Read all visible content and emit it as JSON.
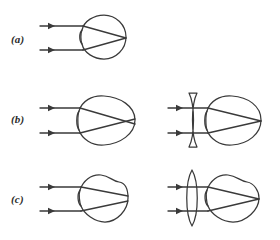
{
  "figure": {
    "background_color": "#ffffff",
    "ink_color": "#3a3a3a",
    "width": 280,
    "height": 240
  },
  "panels": [
    {
      "key": "a",
      "label": "(a)",
      "label_x": 11,
      "label_y": 33,
      "condition": "normal-eye",
      "description": "Parallel rays refract at the cornea and focus exactly on the retina",
      "has_corrective_lens": false,
      "eye_shape": "circular",
      "groups": [
        {
          "name": "uncorrected-eye-group",
          "eye": {
            "shape": "circle",
            "center_x": 104,
            "center_y": 37,
            "radius_x": 22,
            "radius_y": 22,
            "cornea_x": 82,
            "retina_x": 126
          },
          "rays": [
            {
              "name": "upper-ray",
              "start_x": 40,
              "start_y": 26,
              "cornea_y": 26,
              "focus_x": 126,
              "focus_y": 38
            },
            {
              "name": "lower-ray",
              "start_x": 40,
              "start_y": 50,
              "cornea_y": 50,
              "focus_x": 126,
              "focus_y": 38
            }
          ],
          "focus_location": "on-retina"
        }
      ]
    },
    {
      "key": "b",
      "label": "(b)",
      "label_x": 11,
      "label_y": 113,
      "condition": "myopia-nearsighted",
      "description": "Elongated eyeball focuses rays in front of the retina; a concave diverging lens corrects it",
      "has_corrective_lens": true,
      "corrective_lens_type": "concave-diverging",
      "eye_shape": "elongated-oval",
      "groups": [
        {
          "name": "uncorrected-eye-group",
          "eye": {
            "shape": "oval-elongated",
            "center_x": 107,
            "center_y": 120,
            "radius_x": 28,
            "radius_y": 23,
            "cornea_x": 79,
            "retina_x": 135
          },
          "rays": [
            {
              "name": "upper-ray",
              "start_x": 40,
              "start_y": 108,
              "cornea_y": 108,
              "focus_x": 126,
              "focus_y": 121
            },
            {
              "name": "lower-ray",
              "start_x": 40,
              "start_y": 133,
              "cornea_y": 133,
              "focus_x": 126,
              "focus_y": 121
            }
          ],
          "focus_location": "in-front-of-retina"
        },
        {
          "name": "corrected-eye-group",
          "lens": {
            "name": "concave-lens",
            "type": "concave-diverging",
            "center_x": 193,
            "center_y": 120,
            "half_height": 28,
            "thickness": 6
          },
          "eye": {
            "shape": "oval-elongated",
            "center_x": 234,
            "center_y": 120,
            "radius_x": 27,
            "radius_y": 23,
            "cornea_x": 207,
            "retina_x": 261
          },
          "rays": [
            {
              "name": "upper-ray",
              "start_x": 168,
              "start_y": 108,
              "cornea_y": 108,
              "focus_x": 261,
              "focus_y": 121
            },
            {
              "name": "lower-ray",
              "start_x": 168,
              "start_y": 133,
              "cornea_y": 133,
              "focus_x": 261,
              "focus_y": 121
            }
          ],
          "focus_location": "on-retina"
        }
      ]
    },
    {
      "key": "c",
      "label": "(c)",
      "label_x": 11,
      "label_y": 193,
      "condition": "hyperopia-farsighted",
      "description": "Shortened eyeball focuses rays behind the retina; a convex converging lens corrects it",
      "has_corrective_lens": true,
      "corrective_lens_type": "convex-converging",
      "eye_shape": "flattened-round",
      "groups": [
        {
          "name": "uncorrected-eye-group",
          "eye": {
            "shape": "round-flattened",
            "center_x": 104,
            "center_y": 198,
            "radius_x": 24,
            "radius_y": 24,
            "cornea_x": 80,
            "retina_x": 128
          },
          "rays": [
            {
              "name": "upper-ray",
              "start_x": 40,
              "start_y": 187,
              "cornea_y": 187,
              "focus_x": 132,
              "focus_y": 199
            },
            {
              "name": "lower-ray",
              "start_x": 40,
              "start_y": 211,
              "cornea_y": 211,
              "focus_x": 132,
              "focus_y": 199
            }
          ],
          "focus_location": "behind-retina"
        },
        {
          "name": "corrected-eye-group",
          "lens": {
            "name": "convex-lens",
            "type": "convex-converging",
            "center_x": 192,
            "center_y": 198,
            "half_height": 28,
            "thickness": 11
          },
          "eye": {
            "shape": "round-flattened",
            "center_x": 233,
            "center_y": 198,
            "radius_x": 26,
            "radius_y": 24,
            "cornea_x": 207,
            "retina_x": 259
          },
          "rays": [
            {
              "name": "upper-ray",
              "start_x": 168,
              "start_y": 187,
              "cornea_y": 187,
              "focus_x": 259,
              "focus_y": 199
            },
            {
              "name": "lower-ray",
              "start_x": 168,
              "start_y": 211,
              "cornea_y": 211,
              "focus_x": 259,
              "focus_y": 199
            }
          ],
          "focus_location": "on-retina"
        }
      ]
    }
  ]
}
